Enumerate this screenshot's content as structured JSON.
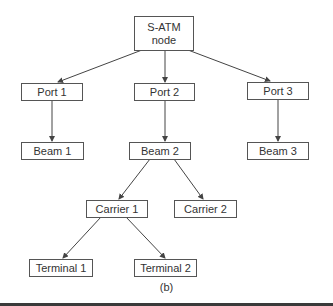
{
  "diagram": {
    "nodes": {
      "root": {
        "label": "S-ATM\nnode"
      },
      "port1": {
        "label": "Port 1"
      },
      "port2": {
        "label": "Port 2"
      },
      "port3": {
        "label": "Port 3"
      },
      "beam1": {
        "label": "Beam 1"
      },
      "beam2": {
        "label": "Beam 2"
      },
      "beam3": {
        "label": "Beam 3"
      },
      "carrier1": {
        "label": "Carrier 1"
      },
      "carrier2": {
        "label": "Carrier 2"
      },
      "terminal1": {
        "label": "Terminal 1"
      },
      "terminal2": {
        "label": "Terminal 2"
      }
    },
    "edges": [
      [
        "root",
        "port1"
      ],
      [
        "root",
        "port2"
      ],
      [
        "root",
        "port3"
      ],
      [
        "port1",
        "beam1"
      ],
      [
        "port2",
        "beam2"
      ],
      [
        "port3",
        "beam3"
      ],
      [
        "beam2",
        "carrier1"
      ],
      [
        "beam2",
        "carrier2"
      ],
      [
        "carrier1",
        "terminal1"
      ],
      [
        "carrier1",
        "terminal2"
      ]
    ],
    "caption": "(b)",
    "colors": {
      "line": "#444444",
      "box_border": "#555555",
      "text": "#333333"
    }
  }
}
